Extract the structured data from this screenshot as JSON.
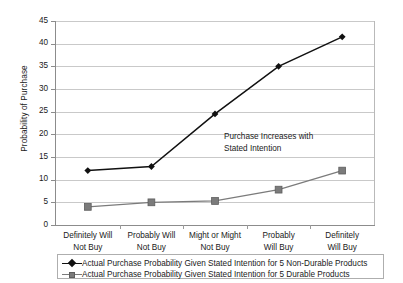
{
  "chart_data": {
    "type": "line",
    "title": "",
    "xlabel": "",
    "ylabel": "Probability of Purchase",
    "ylim": [
      0,
      45
    ],
    "ytick_step": 5,
    "yticks": [
      "0",
      "5",
      "10",
      "15",
      "20",
      "25",
      "30",
      "35",
      "40",
      "45"
    ],
    "grid": true,
    "legend_position": "below",
    "categories": [
      "Definitely Will\nNot Buy",
      "Probably Will\nNot Buy",
      "Might or Might\nNot Buy",
      "Probably\nWill Buy",
      "Definitely\nWill Buy"
    ],
    "category_lines": [
      [
        "Definitely Will",
        "Not Buy"
      ],
      [
        "Probably Will",
        "Not Buy"
      ],
      [
        "Might or Might",
        "Not Buy"
      ],
      [
        "Probably",
        "Will Buy"
      ],
      [
        "Definitely",
        "Will Buy"
      ]
    ],
    "series": [
      {
        "name": "Actual Purchase Probability Given Stated Intention for 5 Non-Durable Products",
        "values": [
          12.0,
          12.9,
          24.5,
          35.0,
          41.5
        ],
        "color": "#111111",
        "marker": "diamond"
      },
      {
        "name": "Actual Purchase Probability Given Stated Intention for 5 Durable Products",
        "values": [
          4.0,
          5.0,
          5.3,
          7.8,
          12.0
        ],
        "color": "#7b7b7b",
        "marker": "square"
      }
    ],
    "annotations": [
      {
        "text_line1": "Purchase Increases with",
        "text_line2": "Stated Intention",
        "x": 224,
        "y": 131
      }
    ]
  },
  "legend": {
    "entries": [
      {
        "label": "Actual Purchase Probability Given Stated Intention for 5 Non-Durable Products"
      },
      {
        "label": "Actual Purchase Probability Given Stated Intention for 5 Durable Products"
      }
    ]
  }
}
